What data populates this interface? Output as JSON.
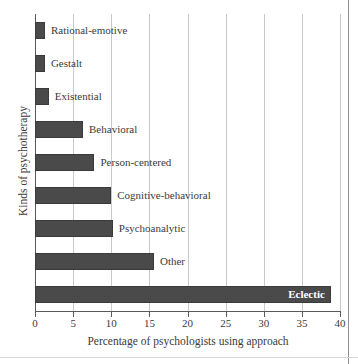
{
  "chart_data": {
    "type": "bar",
    "orientation": "horizontal",
    "title": "",
    "xlabel": "Percentage of psychologists using approach",
    "ylabel": "Kinds of psychotherapy",
    "xlim": [
      0,
      40
    ],
    "xticks": [
      0,
      5,
      10,
      15,
      20,
      25,
      30,
      35,
      40
    ],
    "grid": "vertical",
    "legend": "none",
    "bar_color": "#4a4a4a",
    "categories": [
      "Rational-emotive",
      "Gestalt",
      "Existential",
      "Behavioral",
      "Person-centered",
      "Cognitive-behavioral",
      "Psychoanalytic",
      "Other",
      "Eclectic"
    ],
    "values": [
      1.3,
      1.3,
      1.8,
      6.3,
      7.8,
      10.0,
      10.2,
      15.6,
      38.8
    ],
    "bars": [
      {
        "label": "Rational-emotive",
        "value": 1.3,
        "label_position": "outside"
      },
      {
        "label": "Gestalt",
        "value": 1.3,
        "label_position": "outside"
      },
      {
        "label": "Existential",
        "value": 1.8,
        "label_position": "outside"
      },
      {
        "label": "Behavioral",
        "value": 6.3,
        "label_position": "outside"
      },
      {
        "label": "Person-centered",
        "value": 7.8,
        "label_position": "outside"
      },
      {
        "label": "Cognitive-behavioral",
        "value": 10.0,
        "label_position": "outside"
      },
      {
        "label": "Psychoanalytic",
        "value": 10.2,
        "label_position": "outside"
      },
      {
        "label": "Other",
        "value": 15.6,
        "label_position": "outside"
      },
      {
        "label": "Eclectic",
        "value": 38.8,
        "label_position": "inside"
      }
    ]
  }
}
